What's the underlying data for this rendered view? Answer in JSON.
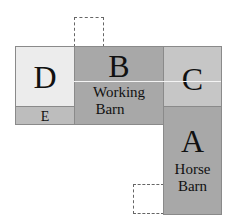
{
  "diagram": {
    "rooms": {
      "D": {
        "letter": "D",
        "label": "",
        "color": "#ececec"
      },
      "E": {
        "letter": "E",
        "color": "#bdbdbd"
      },
      "B": {
        "letter": "B",
        "label_line1": "Working",
        "label_line2": "Barn",
        "color": "#a8a8a8"
      },
      "C": {
        "letter": "C",
        "color": "#c6c6c6"
      },
      "A": {
        "letter": "A",
        "label_line1": "Horse",
        "label_line2": "Barn",
        "color": "#a8a8a8"
      }
    },
    "dashed_outlines": [
      "top-of-B",
      "left-of-A-bottom"
    ]
  }
}
